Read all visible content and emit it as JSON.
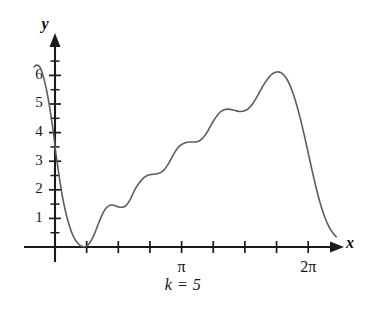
{
  "caption": "k = 5",
  "axes": {
    "x_axis_name": "x",
    "y_axis_name": "y",
    "x_tick_labels": [
      {
        "text": "π",
        "x_value": 3.14159
      },
      {
        "text": "2π",
        "x_value": 6.28319
      }
    ],
    "y_tick_labels": [
      "1",
      "2",
      "3",
      "4",
      "5",
      "6"
    ]
  },
  "colors": {
    "curve": "#5c5c5c",
    "axis": "#1a1a1a",
    "background": "#ffffff",
    "text": "#111111"
  },
  "chart_data": {
    "type": "line",
    "title": "k = 5",
    "xlabel": "x",
    "ylabel": "y",
    "xlim": [
      -0.55,
      7.3
    ],
    "ylim": [
      -0.35,
      6.9
    ],
    "grid": false,
    "legend": false,
    "x_tick_values": [
      0.7854,
      1.5708,
      2.3562,
      3.14159,
      3.92699,
      4.71239,
      5.49779,
      6.28319
    ],
    "x_tick_labels_shown": {
      "3.14159": "π",
      "6.28319": "2π"
    },
    "y_tick_values": [
      1,
      2,
      3,
      4,
      5,
      6
    ],
    "y_minor_tick_step": 0.5,
    "series": [
      {
        "name": "partial Fourier sum, k = 5",
        "x": [
          -0.52,
          -0.45,
          -0.38,
          -0.32,
          -0.26,
          -0.2,
          -0.14,
          -0.08,
          -0.02,
          0.0,
          0.05,
          0.1,
          0.15,
          0.2,
          0.26,
          0.32,
          0.38,
          0.44,
          0.5,
          0.56,
          0.62,
          0.68,
          0.74,
          0.8,
          0.86,
          0.92,
          0.98,
          1.04,
          1.1,
          1.16,
          1.22,
          1.28,
          1.34,
          1.4,
          1.46,
          1.52,
          1.58,
          1.64,
          1.7,
          1.76,
          1.82,
          1.88,
          1.94,
          2.0,
          2.08,
          2.16,
          2.24,
          2.32,
          2.4,
          2.48,
          2.56,
          2.64,
          2.72,
          2.8,
          2.88,
          2.96,
          3.04,
          3.12,
          3.2,
          3.28,
          3.36,
          3.44,
          3.52,
          3.6,
          3.68,
          3.76,
          3.84,
          3.92,
          4.0,
          4.1,
          4.2,
          4.3,
          4.4,
          4.5,
          4.6,
          4.7,
          4.8,
          4.9,
          5.0,
          5.1,
          5.2,
          5.3,
          5.4,
          5.5,
          5.6,
          5.7,
          5.8,
          5.9,
          6.0,
          6.1,
          6.2,
          6.3,
          6.4,
          6.5,
          6.6,
          6.7,
          6.8,
          6.9,
          6.98
        ],
        "y": [
          6.3,
          6.36,
          6.3,
          6.1,
          5.8,
          5.42,
          4.95,
          4.4,
          3.8,
          3.5,
          3.0,
          2.5,
          2.05,
          1.65,
          1.25,
          0.92,
          0.65,
          0.42,
          0.26,
          0.14,
          0.06,
          0.02,
          0.01,
          0.05,
          0.14,
          0.28,
          0.46,
          0.68,
          0.9,
          1.1,
          1.26,
          1.38,
          1.44,
          1.47,
          1.46,
          1.43,
          1.4,
          1.39,
          1.4,
          1.45,
          1.55,
          1.7,
          1.88,
          2.05,
          2.22,
          2.36,
          2.46,
          2.52,
          2.54,
          2.55,
          2.57,
          2.62,
          2.72,
          2.88,
          3.08,
          3.28,
          3.45,
          3.56,
          3.63,
          3.66,
          3.67,
          3.67,
          3.68,
          3.73,
          3.83,
          3.98,
          4.18,
          4.38,
          4.55,
          4.72,
          4.8,
          4.82,
          4.8,
          4.76,
          4.74,
          4.76,
          4.84,
          5.0,
          5.22,
          5.48,
          5.72,
          5.92,
          6.06,
          6.12,
          6.1,
          5.98,
          5.75,
          5.4,
          4.95,
          4.42,
          3.82,
          3.18,
          2.55,
          1.96,
          1.44,
          1.02,
          0.7,
          0.48,
          0.36
        ]
      }
    ]
  }
}
